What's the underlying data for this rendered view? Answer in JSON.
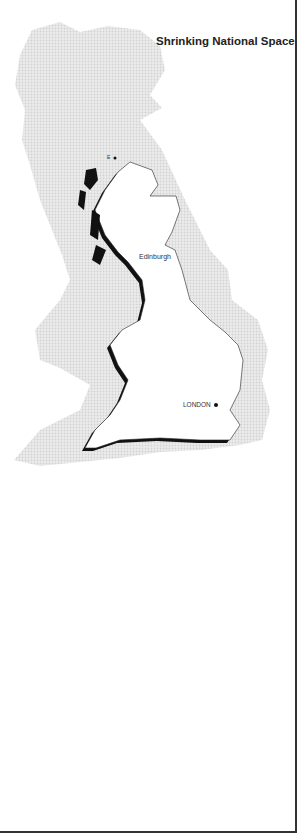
{
  "title": "Shrinking National Space",
  "labels": {
    "small_island": "E",
    "edinburgh": "Edinburgh",
    "london": "LONDON"
  },
  "colors": {
    "background": "#ffffff",
    "ghost_map": "#e4e4e4",
    "shrunk_map_fill": "#ffffff",
    "coast_shadow": "#111111",
    "border": "#333333"
  }
}
